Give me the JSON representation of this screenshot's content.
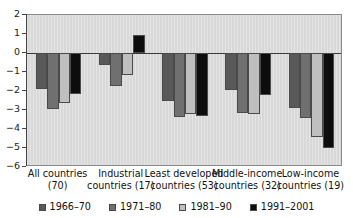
{
  "chart_data": {
    "type": "bar",
    "title": "",
    "subtitle": "",
    "xlabel": "",
    "ylabel": "",
    "ylim": [
      -6,
      2
    ],
    "yticks": [
      2,
      1,
      0,
      -1,
      -2,
      -3,
      -4,
      -5,
      -6
    ],
    "ytick_labels": [
      "2",
      "1",
      "0",
      "−1",
      "−2",
      "−3",
      "−4",
      "−5",
      "−6"
    ],
    "grid": false,
    "legend_position": "bottom",
    "categories": [
      "All countries (70)",
      "Industrial countries (17)",
      "Least developed countries (53)",
      "Middle-income countries (32)",
      "Low-income countries (19)"
    ],
    "category_lines": [
      [
        "All countries",
        "(70)"
      ],
      [
        "Industrial",
        "countries (17)"
      ],
      [
        "Least developed",
        "countries (53)"
      ],
      [
        "Middle-income",
        "countries (32)"
      ],
      [
        "Low-income",
        "countries (19)"
      ]
    ],
    "series": [
      {
        "name": "1966–70",
        "color": "#595959",
        "values": [
          -1.9,
          -0.65,
          -2.5,
          -1.95,
          -2.9
        ]
      },
      {
        "name": "1971–80",
        "color": "#707070",
        "values": [
          -2.95,
          -1.75,
          -3.35,
          -3.15,
          -3.4
        ]
      },
      {
        "name": "1981–90",
        "color": "#bfbfbf",
        "values": [
          -2.65,
          -1.15,
          -3.2,
          -3.2,
          -4.4
        ]
      },
      {
        "name": "1991–2001",
        "color": "#0d0d0d",
        "values": [
          -2.15,
          0.95,
          -3.3,
          -2.2,
          -5.0
        ]
      }
    ]
  },
  "legend": {
    "items": [
      {
        "label": "1966–70",
        "color": "#595959"
      },
      {
        "label": "1971–80",
        "color": "#707070"
      },
      {
        "label": "1981–90",
        "color": "#bfbfbf"
      },
      {
        "label": "1991–2001",
        "color": "#0d0d0d"
      }
    ]
  },
  "colors": {
    "plot_background": "#d8d8d8",
    "plot_border": "#8a8a8a",
    "axis": "#444444",
    "text": "#111111"
  }
}
